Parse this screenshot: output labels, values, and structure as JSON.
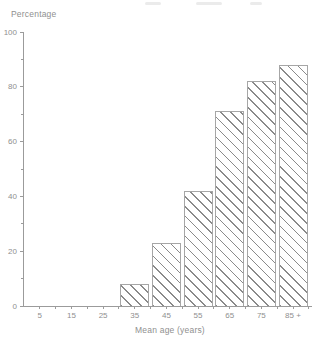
{
  "figure": {
    "y_axis_title": "Percentage",
    "x_axis_title": "Mean age (years)"
  },
  "chart_data": {
    "type": "bar",
    "title": "",
    "ylabel": "Percentage",
    "xlabel": "Mean age (years)",
    "ylim": [
      0,
      100
    ],
    "y_major_ticks": [
      0,
      20,
      40,
      60,
      80,
      100
    ],
    "y_minor_ticks": [
      10,
      30,
      50,
      70,
      90
    ],
    "x_axis_range_years": [
      0,
      91
    ],
    "x_minor_tick_step_years": 5,
    "grid": false,
    "legend": false,
    "categories": [
      "35",
      "45",
      "55",
      "65",
      "75",
      "85 +"
    ],
    "values": [
      8,
      23,
      42,
      71,
      82,
      88
    ],
    "bars": [
      {
        "age": 35,
        "label": "35",
        "value": 8
      },
      {
        "age": 45,
        "label": "45",
        "value": 23
      },
      {
        "age": 55,
        "label": "55",
        "value": 42
      },
      {
        "age": 65,
        "label": "65",
        "value": 71
      },
      {
        "age": 75,
        "label": "75",
        "value": 82
      },
      {
        "age": 85,
        "label": "85 +",
        "value": 88
      }
    ],
    "x_tick_labels": [
      {
        "age": 5,
        "label": "5"
      },
      {
        "age": 15,
        "label": "15"
      },
      {
        "age": 25,
        "label": "25"
      },
      {
        "age": 35,
        "label": "35"
      },
      {
        "age": 45,
        "label": "45"
      },
      {
        "age": 55,
        "label": "55"
      },
      {
        "age": 65,
        "label": "65"
      },
      {
        "age": 75,
        "label": "75"
      },
      {
        "age": 85,
        "label": "85 +"
      }
    ],
    "bar_style": {
      "fill": "#ffffff",
      "hatch": "diagonal-backslash",
      "hatch_color": "#8a8a8a",
      "outline_color": "#a6a6a6"
    },
    "colors": {
      "axis": "#9b9b9b",
      "text": "#8f8f8f",
      "background": "#ffffff"
    }
  }
}
